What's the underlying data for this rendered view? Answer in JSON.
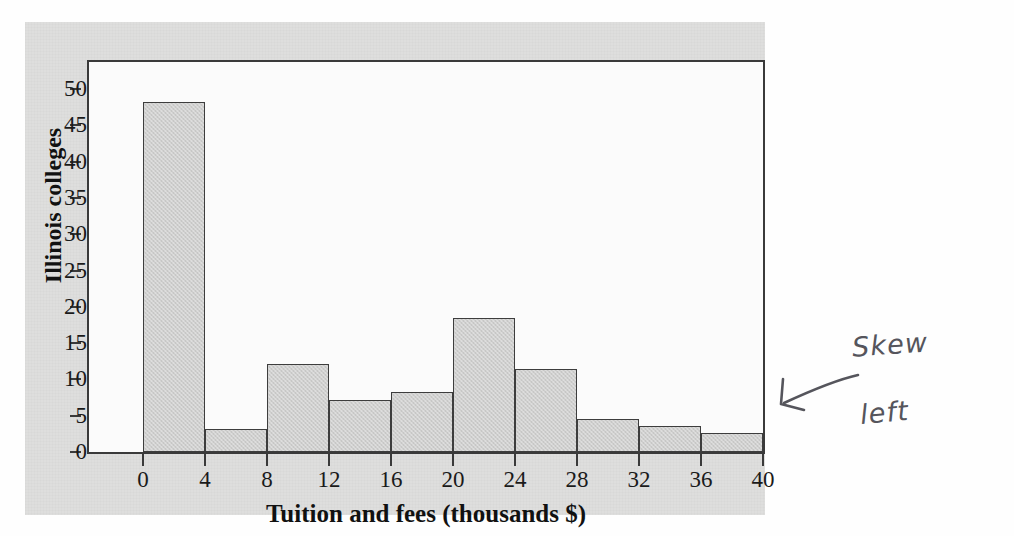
{
  "figure": {
    "background_color": "#dededd",
    "plot_background_color": "#fbfbfb",
    "axis_color": "#3a3a3a",
    "bar_fill_color": "#cfcfce",
    "bar_edge_color": "#3d3d3d"
  },
  "chart_data": {
    "type": "bar",
    "title": "",
    "subtitle": "",
    "xlabel": "Tuition and fees (thousands $)",
    "ylabel": "Illinois colleges",
    "xlim": [
      0,
      40
    ],
    "ylim": [
      0,
      50
    ],
    "bin_width": 4,
    "grid": false,
    "legend": null,
    "x_ticks": [
      "0",
      "4",
      "8",
      "12",
      "16",
      "20",
      "24",
      "28",
      "32",
      "36",
      "40"
    ],
    "x_tick_values": [
      0,
      4,
      8,
      12,
      16,
      20,
      24,
      28,
      32,
      36,
      40
    ],
    "y_ticks": [
      "0",
      "5",
      "10",
      "15",
      "20",
      "25",
      "30",
      "35",
      "40",
      "45",
      "50"
    ],
    "y_tick_values": [
      0,
      5,
      10,
      15,
      20,
      25,
      30,
      35,
      40,
      45,
      50
    ],
    "categories": [
      "0-4",
      "4-8",
      "8-12",
      "12-16",
      "16-20",
      "20-24",
      "24-28",
      "28-32",
      "32-36",
      "36-40"
    ],
    "bins": [
      {
        "label": "0-4",
        "x0": 0,
        "x1": 4,
        "value": 48.2
      },
      {
        "label": "4-8",
        "x0": 4,
        "x1": 8,
        "value": 3.2
      },
      {
        "label": "8-12",
        "x0": 8,
        "x1": 12,
        "value": 12.1
      },
      {
        "label": "12-16",
        "x0": 12,
        "x1": 16,
        "value": 7.2
      },
      {
        "label": "16-20",
        "x0": 16,
        "x1": 20,
        "value": 8.3
      },
      {
        "label": "20-24",
        "x0": 20,
        "x1": 24,
        "value": 18.5
      },
      {
        "label": "24-28",
        "x0": 24,
        "x1": 28,
        "value": 11.4
      },
      {
        "label": "28-32",
        "x0": 28,
        "x1": 32,
        "value": 4.5
      },
      {
        "label": "32-36",
        "x0": 32,
        "x1": 36,
        "value": 3.6
      },
      {
        "label": "36-40",
        "x0": 36,
        "x1": 40,
        "value": 2.6
      }
    ],
    "values": [
      48.2,
      3.2,
      12.1,
      7.2,
      8.3,
      18.5,
      11.4,
      4.5,
      3.6,
      2.6
    ]
  },
  "annotation": {
    "line1": "Skew",
    "line2": "left",
    "arrow": "arrow-pointing-left",
    "ink_color": "#55555c"
  },
  "ghost_text": [
    {
      "text": "the distribution",
      "left": 170,
      "top": 70,
      "size": 16
    },
    {
      "text": "in a symmetric",
      "left": 420,
      "top": 68,
      "size": 16
    },
    {
      "text": "Figure 1.8",
      "left": 540,
      "top": 98,
      "size": 16
    },
    {
      "text": "a histogram of",
      "left": 195,
      "top": 100,
      "size": 15
    },
    {
      "text": "the values",
      "left": 160,
      "top": 200,
      "size": 15
    },
    {
      "text": "skewed to",
      "left": 330,
      "top": 182,
      "size": 15
    },
    {
      "text": "right tail",
      "left": 500,
      "top": 215,
      "size": 15
    },
    {
      "text": "the data set",
      "left": 210,
      "top": 290,
      "size": 15
    },
    {
      "text": "distribution",
      "left": 450,
      "top": 300,
      "size": 15
    }
  ]
}
